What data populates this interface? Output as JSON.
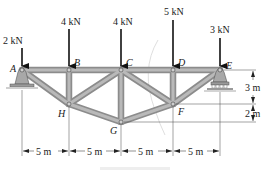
{
  "figure": {
    "type": "planar truss",
    "nodes": {
      "A": {
        "label": "A",
        "x": 0,
        "y": 0
      },
      "B": {
        "label": "B",
        "x": 5,
        "y": 0
      },
      "C": {
        "label": "C",
        "x": 10,
        "y": 0
      },
      "D": {
        "label": "D",
        "x": 15,
        "y": 0
      },
      "E": {
        "label": "E",
        "x": 20,
        "y": 0
      },
      "H": {
        "label": "H",
        "x": 5,
        "y": -3
      },
      "G": {
        "label": "G",
        "x": 10,
        "y": -5
      },
      "F": {
        "label": "F",
        "x": 15,
        "y": -3
      }
    },
    "members": [
      "AB",
      "BC",
      "CD",
      "DE",
      "AH",
      "HG",
      "GF",
      "FE",
      "BH",
      "CH",
      "CG",
      "CF",
      "DF"
    ],
    "loads": [
      {
        "node": "A",
        "label": "2 kN"
      },
      {
        "node": "B",
        "label": "4 kN"
      },
      {
        "node": "C",
        "label": "4 kN"
      },
      {
        "node": "D",
        "label": "5 kN"
      },
      {
        "node": "E",
        "label": "3 kN"
      }
    ],
    "supports": [
      {
        "node": "A",
        "type": "pin"
      },
      {
        "node": "E",
        "type": "roller"
      }
    ],
    "dimensions": {
      "horizontal": [
        "5 m",
        "5 m",
        "5 m",
        "5 m"
      ],
      "vertical": [
        "3 m",
        "2 m"
      ]
    }
  }
}
